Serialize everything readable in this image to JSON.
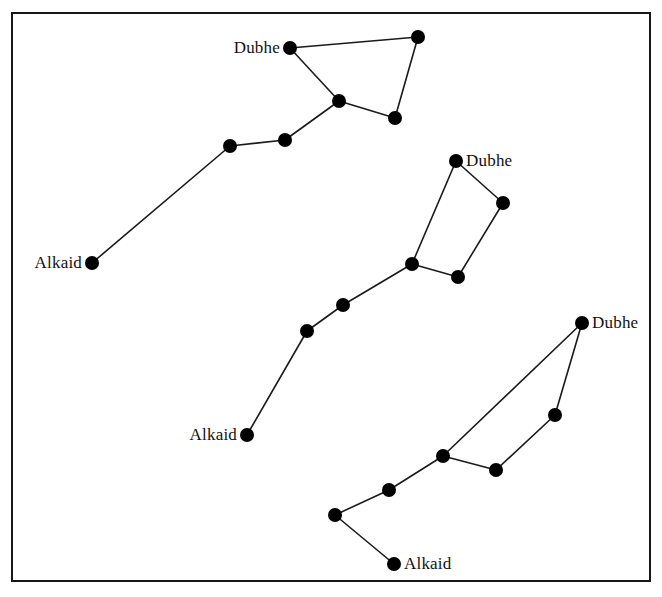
{
  "figure": {
    "background_color": "#ffffff",
    "border_color": "#171717",
    "star_color": "#000000",
    "line_color": "#1a1a1a",
    "star_radius": 7,
    "frame": {
      "x": 11,
      "y": 12,
      "width": 636,
      "height": 566
    }
  },
  "chart_data": {
    "type": "scatter",
    "xlabel": "",
    "ylabel": "",
    "xlim": [
      0,
      662
    ],
    "ylim": [
      0,
      597
    ],
    "grid": false,
    "legend": "none",
    "series": [
      {
        "name": "top-dipper",
        "points": [
          {
            "id": "t1",
            "label": "Dubhe",
            "x": 290,
            "y": 48,
            "label_side": "left"
          },
          {
            "id": "t2",
            "label": "",
            "x": 418,
            "y": 37,
            "label_side": "none"
          },
          {
            "id": "t3",
            "label": "",
            "x": 395,
            "y": 118,
            "label_side": "none"
          },
          {
            "id": "t4",
            "label": "",
            "x": 339,
            "y": 101,
            "label_side": "none"
          },
          {
            "id": "t5",
            "label": "",
            "x": 285,
            "y": 140,
            "label_side": "none"
          },
          {
            "id": "t6",
            "label": "",
            "x": 230,
            "y": 146,
            "label_side": "none"
          },
          {
            "id": "t7",
            "label": "Alkaid",
            "x": 92,
            "y": 263,
            "label_side": "left"
          }
        ],
        "edges": [
          [
            "t1",
            "t2"
          ],
          [
            "t2",
            "t3"
          ],
          [
            "t3",
            "t4"
          ],
          [
            "t4",
            "t1"
          ],
          [
            "t4",
            "t5"
          ],
          [
            "t5",
            "t6"
          ],
          [
            "t6",
            "t7"
          ]
        ]
      },
      {
        "name": "middle-dipper",
        "points": [
          {
            "id": "m1",
            "label": "Dubhe",
            "x": 456,
            "y": 161,
            "label_side": "right"
          },
          {
            "id": "m2",
            "label": "",
            "x": 503,
            "y": 203,
            "label_side": "none"
          },
          {
            "id": "m3",
            "label": "",
            "x": 458,
            "y": 277,
            "label_side": "none"
          },
          {
            "id": "m4",
            "label": "",
            "x": 412,
            "y": 264,
            "label_side": "none"
          },
          {
            "id": "m5",
            "label": "",
            "x": 343,
            "y": 305,
            "label_side": "none"
          },
          {
            "id": "m6",
            "label": "",
            "x": 307,
            "y": 331,
            "label_side": "none"
          },
          {
            "id": "m7",
            "label": "Alkaid",
            "x": 247,
            "y": 435,
            "label_side": "left"
          }
        ],
        "edges": [
          [
            "m1",
            "m2"
          ],
          [
            "m2",
            "m3"
          ],
          [
            "m3",
            "m4"
          ],
          [
            "m4",
            "m1"
          ],
          [
            "m4",
            "m5"
          ],
          [
            "m5",
            "m6"
          ],
          [
            "m6",
            "m7"
          ]
        ]
      },
      {
        "name": "bottom-dipper",
        "points": [
          {
            "id": "b1",
            "label": "Dubhe",
            "x": 582,
            "y": 323,
            "label_side": "right"
          },
          {
            "id": "b2",
            "label": "",
            "x": 555,
            "y": 415,
            "label_side": "none"
          },
          {
            "id": "b3",
            "label": "",
            "x": 496,
            "y": 470,
            "label_side": "none"
          },
          {
            "id": "b4",
            "label": "",
            "x": 443,
            "y": 456,
            "label_side": "none"
          },
          {
            "id": "b5",
            "label": "",
            "x": 389,
            "y": 490,
            "label_side": "none"
          },
          {
            "id": "b6",
            "label": "",
            "x": 335,
            "y": 515,
            "label_side": "none"
          },
          {
            "id": "b7",
            "label": "Alkaid",
            "x": 394,
            "y": 564,
            "label_side": "right"
          }
        ],
        "edges": [
          [
            "b1",
            "b2"
          ],
          [
            "b2",
            "b3"
          ],
          [
            "b3",
            "b4"
          ],
          [
            "b4",
            "b1"
          ],
          [
            "b4",
            "b5"
          ],
          [
            "b5",
            "b6"
          ],
          [
            "b6",
            "b7"
          ]
        ]
      }
    ]
  }
}
